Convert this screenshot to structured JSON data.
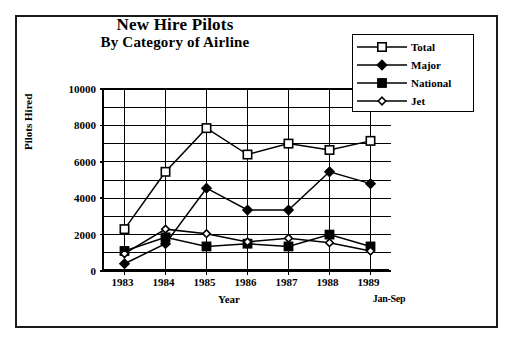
{
  "chart_data": {
    "type": "line",
    "title": "New Hire Pilots",
    "subtitle": "By Category of Airline",
    "xlabel": "Year",
    "xlabel_note": "Jan-Sep",
    "ylabel": "Pilots Hired",
    "categories": [
      "1983",
      "1984",
      "1985",
      "1986",
      "1987",
      "1988",
      "1989"
    ],
    "ylim": [
      0,
      10000
    ],
    "ytick_labels": [
      "0",
      "2000",
      "4000",
      "6000",
      "8000",
      "10000"
    ],
    "ytick_values": [
      0,
      2000,
      4000,
      6000,
      8000,
      10000
    ],
    "minor_gridline_step": 1000,
    "grid": "both",
    "legend_position": "top-right",
    "series": [
      {
        "name": "Total",
        "marker": "open-square",
        "values": [
          2300,
          5450,
          7850,
          6400,
          7000,
          6650,
          7150
        ]
      },
      {
        "name": "Major",
        "marker": "filled-diamond",
        "values": [
          400,
          1500,
          4550,
          3350,
          3350,
          5450,
          4800
        ]
      },
      {
        "name": "National",
        "marker": "filled-square",
        "values": [
          1100,
          1850,
          1350,
          1500,
          1350,
          2000,
          1350
        ]
      },
      {
        "name": "Jet",
        "marker": "open-diamond",
        "values": [
          950,
          2300,
          2050,
          1600,
          1800,
          1550,
          1100
        ]
      }
    ],
    "line_color": "#000000",
    "background_color": "#ffffff"
  }
}
